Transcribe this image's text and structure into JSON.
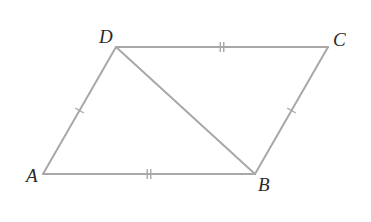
{
  "figure": {
    "type": "parallelogram-with-diagonal",
    "stroke_color": "#a8a8a8",
    "label_color": "#2a2a2a",
    "vertices": {
      "A": {
        "label": "A",
        "x": 43,
        "y": 174,
        "label_x": 26,
        "label_y": 182
      },
      "B": {
        "label": "B",
        "x": 255,
        "y": 174,
        "label_x": 258,
        "label_y": 191
      },
      "C": {
        "label": "C",
        "x": 328,
        "y": 47,
        "label_x": 333,
        "label_y": 46
      },
      "D": {
        "label": "D",
        "x": 116,
        "y": 47,
        "label_x": 99,
        "label_y": 43
      }
    },
    "segments": [
      {
        "name": "AB",
        "from": "A",
        "to": "B",
        "ticks": 2
      },
      {
        "name": "BC",
        "from": "B",
        "to": "C",
        "ticks": 1
      },
      {
        "name": "CD",
        "from": "C",
        "to": "D",
        "ticks": 2
      },
      {
        "name": "DA",
        "from": "D",
        "to": "A",
        "ticks": 1
      },
      {
        "name": "DB",
        "from": "D",
        "to": "B",
        "ticks": 0
      }
    ]
  }
}
